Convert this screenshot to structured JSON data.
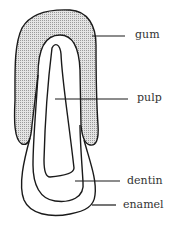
{
  "diagram": {
    "labels": [
      {
        "id": "gum",
        "text": "gum"
      },
      {
        "id": "pulp",
        "text": "pulp"
      },
      {
        "id": "dentin",
        "text": "dentin"
      },
      {
        "id": "enamel",
        "text": "enamel"
      }
    ],
    "colors": {
      "stroke": "#1a1a1a",
      "gum_fill": "#c8c8c8",
      "background": "#ffffff"
    }
  }
}
